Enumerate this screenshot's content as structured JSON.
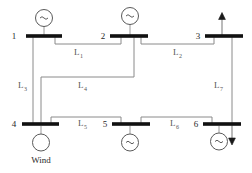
{
  "diagram": {
    "colors": {
      "bus_bar": "#111111",
      "line": "#8a8a8a",
      "generator_outline": "#5a5a5a",
      "arrow": "#1a1a1a",
      "background": "#ffffff"
    },
    "buses": [
      {
        "id": "bus-1",
        "label": "1",
        "x": 26,
        "y": 36,
        "width": 36
      },
      {
        "id": "bus-2",
        "label": "2",
        "x": 110,
        "y": 36,
        "width": 38
      },
      {
        "id": "bus-3",
        "label": "3",
        "x": 205,
        "y": 36,
        "width": 38
      },
      {
        "id": "bus-4",
        "label": "4",
        "x": 22,
        "y": 124,
        "width": 37
      },
      {
        "id": "bus-5",
        "label": "5",
        "x": 112,
        "y": 124,
        "width": 38
      },
      {
        "id": "bus-6",
        "label": "6",
        "x": 203,
        "y": 124,
        "width": 38
      }
    ],
    "generators": [
      {
        "id": "gen-bus-1",
        "symbol": "~",
        "bus": "1"
      },
      {
        "id": "gen-bus-2",
        "symbol": "~",
        "bus": "2"
      },
      {
        "id": "gen-bus-4",
        "symbol": "",
        "bus": "4",
        "caption": "Wind"
      },
      {
        "id": "gen-bus-5",
        "symbol": "~",
        "bus": "5"
      },
      {
        "id": "gen-bus-6",
        "symbol": "~",
        "bus": "6"
      }
    ],
    "transmission_lines": [
      {
        "id": "line-1",
        "label": "L",
        "subscript": "1",
        "from": "1",
        "to": "2"
      },
      {
        "id": "line-2",
        "label": "L",
        "subscript": "2",
        "from": "2",
        "to": "3"
      },
      {
        "id": "line-3",
        "label": "L",
        "subscript": "3",
        "from": "1",
        "to": "4"
      },
      {
        "id": "line-4",
        "label": "L",
        "subscript": "4",
        "from": "4",
        "to": "2"
      },
      {
        "id": "line-5",
        "label": "L",
        "subscript": "5",
        "from": "4",
        "to": "5"
      },
      {
        "id": "line-6",
        "label": "L",
        "subscript": "6",
        "from": "5",
        "to": "6"
      },
      {
        "id": "line-7",
        "label": "L",
        "subscript": "7",
        "from": "3",
        "to": "6"
      }
    ],
    "loads": [
      {
        "id": "load-bus-3",
        "direction": "up",
        "bus": "3"
      },
      {
        "id": "load-bus-6",
        "direction": "down",
        "bus": "6"
      }
    ],
    "captions": {
      "wind": "Wind"
    }
  }
}
